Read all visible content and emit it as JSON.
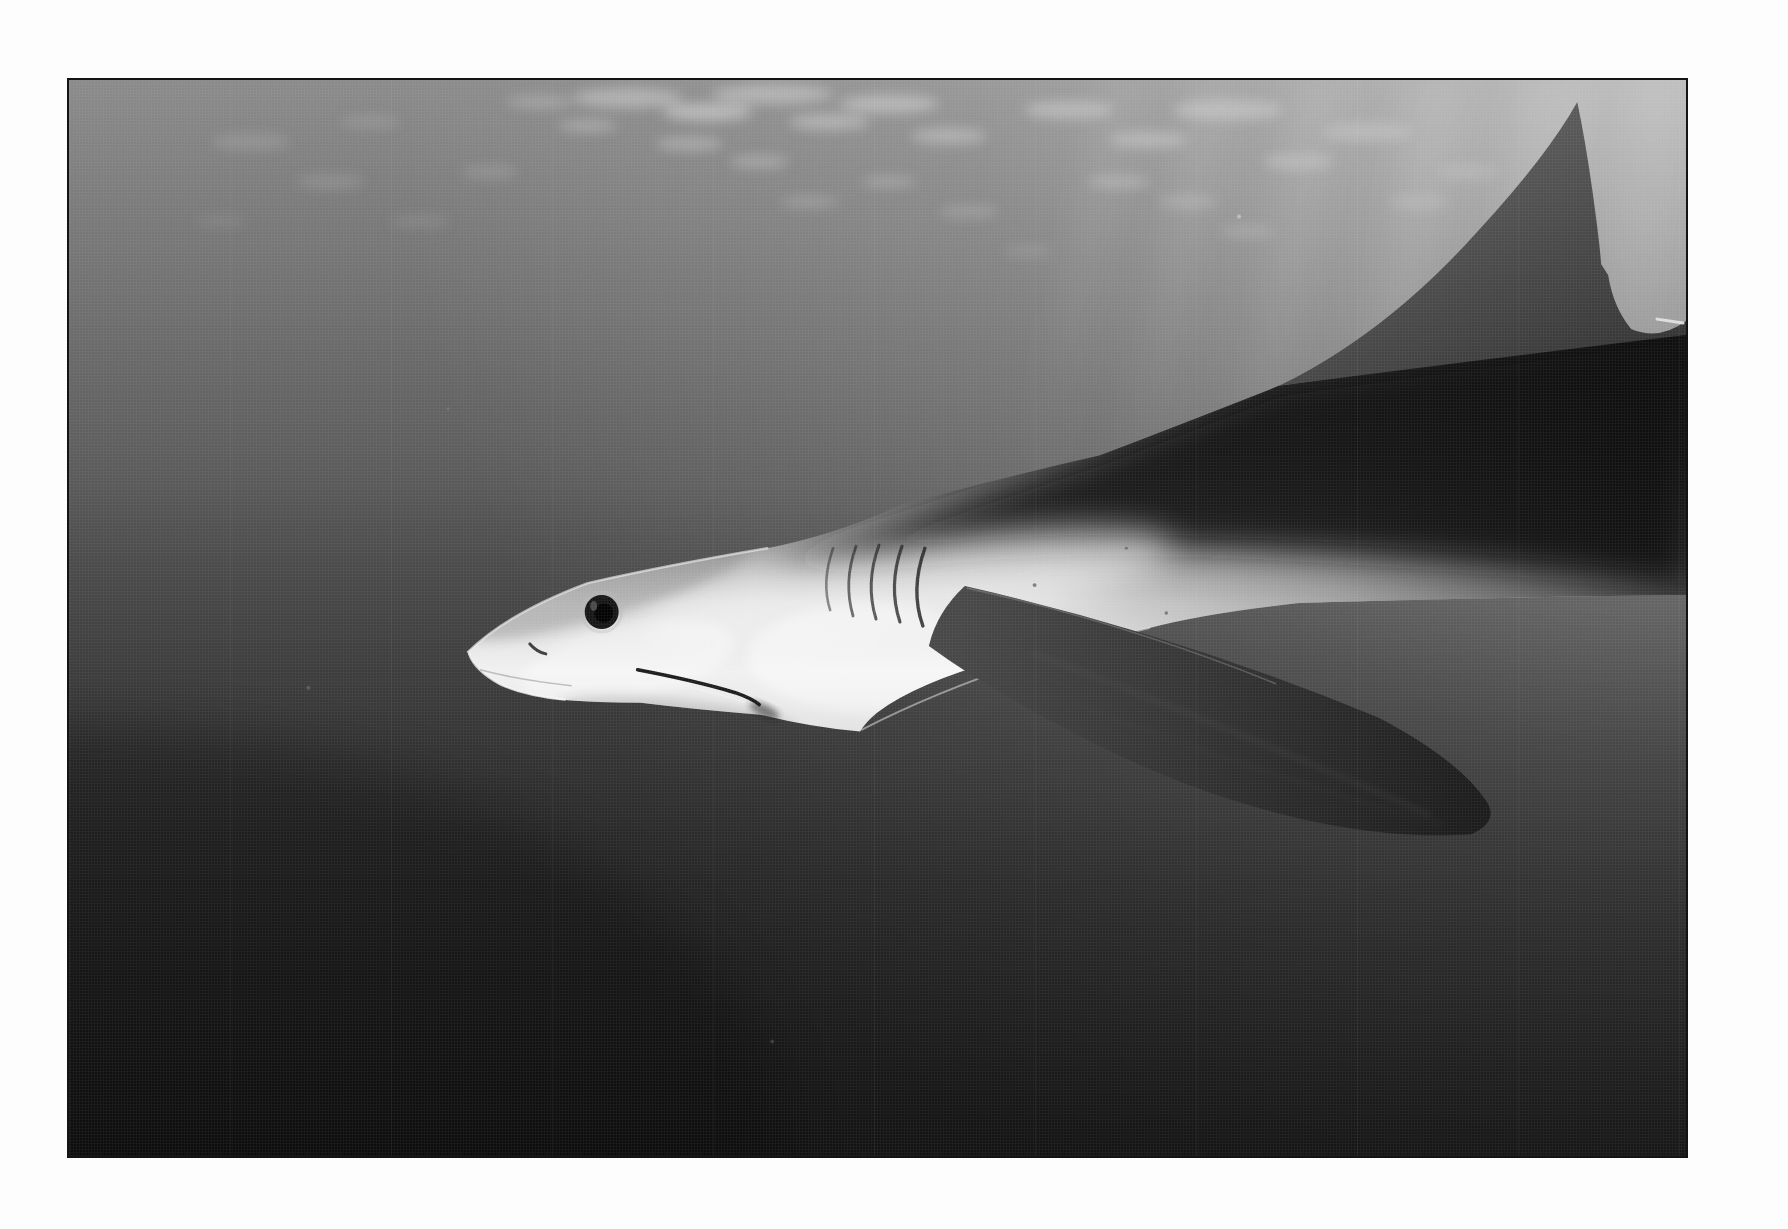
{
  "page": {
    "background": "#fdfdfd",
    "content": "white page margins surrounding a full-bleed photographic plate; no text, captions or page numbers visible"
  },
  "photo": {
    "kind": "black-and-white underwater photograph",
    "subject": "shark in side profile swimming toward the left, near the water surface",
    "description": "long pointed snout with a large dark round eye and slightly open mouth; five thin gill slits; bright silvery-white flank and belly; dark back; tall dark dorsal fin reaching toward the surface at upper right; long dark pectoral fin sweeping down and back; rippled patches of light on the surface above and diagonal sun rays from the upper right; open water fading from pale sunlit gray at top right to near black at bottom left",
    "frame_color": "#141414"
  },
  "features": [
    "water-surface ripple highlights",
    "sun rays from upper right",
    "dorsal fin near the surface",
    "pectoral fin sweeping down-right",
    "five gill slits",
    "dark round eye",
    "mouth line and nostril slit",
    "counter-shaded body: dark back, white belly"
  ],
  "palette": {
    "page": "#fdfdfd",
    "frame": "#141414",
    "water_top": "#8a8a8a",
    "water_mid": "#4f4f4f",
    "water_deep": "#343434",
    "water_bottom": "#242424",
    "sun_glow": "#ffffff",
    "surface_ripple": "#d2d2d2",
    "shark_back": "#1a1a1a",
    "shark_upper": "#454545",
    "shark_silver": "#9a9a9a",
    "shark_flank": "#d9d9d9",
    "shark_belly": "#f1f1f1",
    "shark_chin": "#e3e3e3",
    "pectoral_base": "#474747",
    "pectoral_tip": "#191919",
    "dorsal_light": "#5a5a5a",
    "dorsal_dark": "#2e2e2e",
    "eye_iris": "#161616",
    "eye_pupil": "#030303",
    "gill": "#262626",
    "mouth": "#1c1c1c"
  }
}
